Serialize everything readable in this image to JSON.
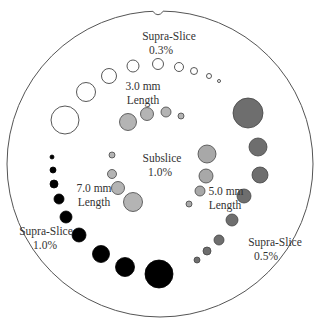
{
  "diagram": {
    "type": "phantom-schematic",
    "outline": {
      "cx": 160,
      "cy": 164,
      "r": 153,
      "stroke": "#555555"
    },
    "colors": {
      "white_fill": "#ffffff",
      "light_grey_fill": "#b4b4b4",
      "mid_grey_fill": "#a8a8a8",
      "dark_grey_fill": "#6e6e6e",
      "black_fill": "#000000",
      "stroke": "#444444"
    },
    "labels": {
      "supra_03_line1": "Supra-Slice",
      "supra_03_line2": "0.3%",
      "len_3mm_line1": "3.0 mm",
      "len_3mm_line2": "Length",
      "subslice_line1": "Subslice",
      "subslice_line2": "1.0%",
      "len_7mm_line1": "7.0 mm",
      "len_7mm_line2": "Length",
      "len_5mm_line1": "5.0 mm",
      "len_5mm_line2": "Length",
      "supra_10_line1": "Supra-Slice",
      "supra_10_line2": "1.0%",
      "supra_05_line1": "Supra-Slice",
      "supra_05_line2": "0.5%"
    },
    "groups": [
      {
        "name": "supra-slice-0.3",
        "fill": "white",
        "circles": [
          [
            65,
            120,
            14
          ],
          [
            86,
            92,
            9.5
          ],
          [
            109,
            76,
            7.5
          ],
          [
            133,
            66,
            6
          ],
          [
            158,
            64,
            5.5
          ],
          [
            179,
            67,
            4.5
          ],
          [
            194,
            71,
            3.5
          ],
          [
            209,
            76,
            2.5
          ],
          [
            219,
            81,
            1.5
          ]
        ]
      },
      {
        "name": "subslice-3mm",
        "fill": "light_grey",
        "circles": [
          [
            128,
            122,
            8.5
          ],
          [
            147,
            114,
            6.5
          ],
          [
            166,
            112,
            5
          ],
          [
            181,
            116,
            3
          ]
        ]
      },
      {
        "name": "supra-slice-0.5",
        "fill": "dark_grey",
        "circles": [
          [
            248,
            113,
            15
          ],
          [
            258,
            147,
            9
          ],
          [
            260,
            175,
            8
          ],
          [
            244,
            196,
            7
          ],
          [
            232,
            220,
            6
          ],
          [
            219,
            240,
            5
          ],
          [
            207,
            251,
            4
          ],
          [
            197,
            260,
            3
          ]
        ]
      },
      {
        "name": "subslice-5mm",
        "fill": "mid_grey",
        "circles": [
          [
            207,
            154,
            9
          ],
          [
            206,
            176,
            7
          ],
          [
            200,
            191,
            5
          ],
          [
            189,
            204,
            3
          ]
        ]
      },
      {
        "name": "subslice-7mm",
        "fill": "light_grey",
        "circles": [
          [
            112,
            155,
            3
          ],
          [
            112,
            174,
            4.5
          ],
          [
            118,
            188,
            6.5
          ],
          [
            133,
            202,
            9.5
          ]
        ]
      },
      {
        "name": "supra-slice-1.0",
        "fill": "black",
        "circles": [
          [
            52,
            157,
            2
          ],
          [
            53,
            170,
            3
          ],
          [
            54,
            184,
            4
          ],
          [
            59,
            199,
            5
          ],
          [
            66,
            217,
            6
          ],
          [
            79,
            235,
            7
          ],
          [
            101,
            254,
            8.5
          ],
          [
            125,
            267,
            9.5
          ],
          [
            159,
            274,
            14
          ]
        ]
      }
    ]
  }
}
